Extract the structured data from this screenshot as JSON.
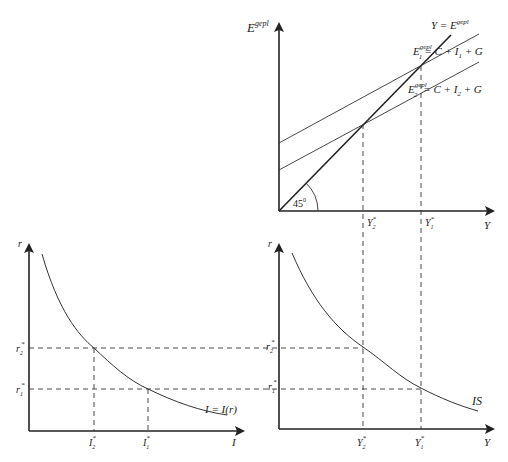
{
  "top_panel": {
    "y_axis_label": "E",
    "y_axis_sup": "gepl",
    "x_axis_label": "Y",
    "line_45_label": "Y = E",
    "line_45_sup": "gepl",
    "line_upper": {
      "prefix": "E",
      "sub": "1",
      "sup": "gepl",
      "rhs": "= C + I",
      "rhs_sub": "1",
      "rhs_tail": " + G"
    },
    "line_lower": {
      "prefix": "E",
      "sub": "2",
      "sup": "gepl",
      "rhs": "= C + I",
      "rhs_sub": "2",
      "rhs_tail": " + G"
    },
    "angle_label": "45",
    "angle_sup": "0",
    "ticks": [
      {
        "label": "Y",
        "sub": "2",
        "sup": "*"
      },
      {
        "label": "Y",
        "sub": "1",
        "sup": "*"
      }
    ]
  },
  "bottom_left_panel": {
    "y_axis_label": "r",
    "x_axis_label": "I",
    "curve_label": "I = I(r)",
    "y_ticks": [
      {
        "label": "r",
        "sub": "2",
        "sup": "*"
      },
      {
        "label": "r",
        "sub": "1",
        "sup": "*"
      }
    ],
    "x_ticks": [
      {
        "label": "I",
        "sub": "2",
        "sup": "*"
      },
      {
        "label": "I",
        "sub": "1",
        "sup": "*"
      }
    ]
  },
  "bottom_right_panel": {
    "y_axis_label": "r",
    "x_axis_label": "Y",
    "curve_label": "IS",
    "y_ticks": [
      {
        "label": "r",
        "sub": "2",
        "sup": "*"
      },
      {
        "label": "r",
        "sub": "1",
        "sup": "*"
      }
    ],
    "x_ticks": [
      {
        "label": "Y",
        "sub": "2",
        "sup": "*"
      },
      {
        "label": "Y",
        "sub": "1",
        "sup": "*"
      }
    ]
  }
}
